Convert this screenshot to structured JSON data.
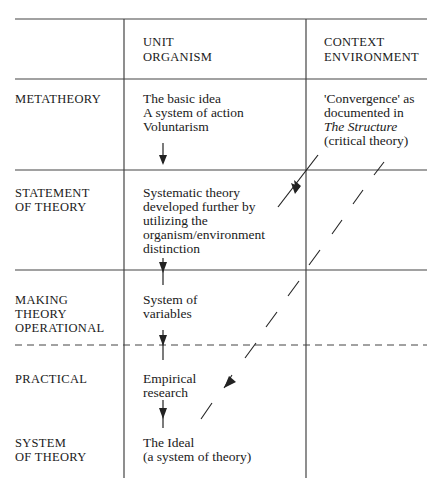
{
  "columns": {
    "unit": [
      "UNIT",
      "ORGANISM"
    ],
    "context": [
      "CONTEXT",
      "ENVIRONMENT"
    ]
  },
  "rows": [
    {
      "label": [
        "METATHEORY"
      ],
      "unit": [
        "The basic idea",
        "A system of action",
        "Voluntarism"
      ],
      "context": [
        "'Convergence' as",
        "documented in",
        "The Structure",
        "(critical theory)"
      ]
    },
    {
      "label": [
        "STATEMENT",
        "OF THEORY"
      ],
      "unit": [
        "Systematic theory",
        "developed further by",
        "utilizing the",
        "organism/environment",
        "distinction"
      ]
    },
    {
      "label": [
        "MAKING",
        "THEORY",
        "OPERATIONAL"
      ],
      "unit": [
        "System of",
        "variables"
      ]
    },
    {
      "label": [
        "PRACTICAL"
      ],
      "unit": [
        "Empirical",
        "research"
      ]
    },
    {
      "label": [
        "SYSTEM",
        "OF THEORY"
      ],
      "unit": [
        "The Ideal",
        "(a system of theory)"
      ]
    }
  ],
  "colors": {
    "ink": "#1a1a1a",
    "line": "#444444"
  }
}
